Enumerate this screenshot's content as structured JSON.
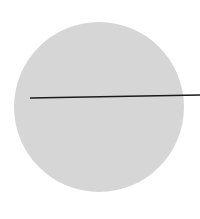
{
  "diagram": {
    "type": "circle-with-radius",
    "background": "#ffffff",
    "circle": {
      "cx": 99,
      "cy": 107,
      "r": 85,
      "fill": "#d6d6d6"
    },
    "line": {
      "x1": 30,
      "y1": 98,
      "x2": 200,
      "y2": 95,
      "stroke": "#1a1a1a",
      "width": 1.5
    }
  }
}
